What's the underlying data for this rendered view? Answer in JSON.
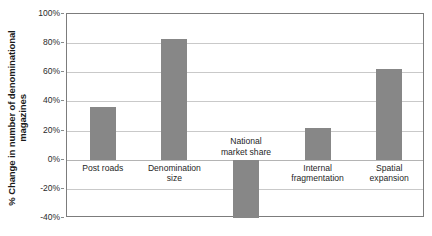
{
  "chart_data": {
    "type": "bar",
    "title": "",
    "xlabel": "",
    "ylabel": "% Change in number of denominational magazines",
    "categories": [
      "Post roads",
      "Denomination size",
      "National market share",
      "Internal fragmentation",
      "Spatial expansion"
    ],
    "values": [
      36,
      83,
      -40,
      22,
      62
    ],
    "ylim": [
      -40,
      100
    ],
    "ytick_labels": [
      "100%",
      "80%",
      "60%",
      "40%",
      "20%",
      "0%",
      "-20%",
      "-40%"
    ],
    "ytick_values": [
      100,
      80,
      60,
      40,
      20,
      0,
      -20,
      -40
    ],
    "grid": true,
    "legend": null,
    "bar_color": "#878787",
    "axis_color": "#7c7c7c",
    "gridline_color": "#c9c9c9",
    "background_color": "#ffffff"
  },
  "axis": {
    "y_title": "% Change in number of denominational magazines"
  },
  "categories_display": [
    "Post roads",
    "Denomination\nsize",
    "National\nmarket share",
    "Internal\nfragmentation",
    "Spatial\nexpansion"
  ]
}
